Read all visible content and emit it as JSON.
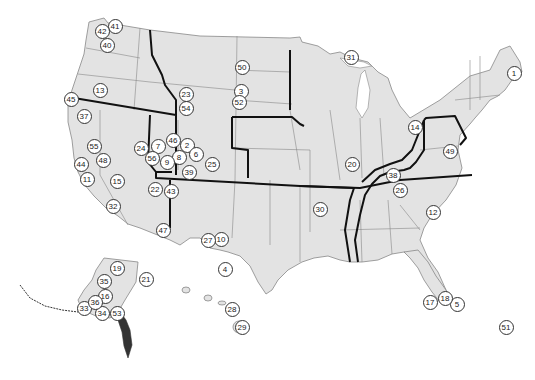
{
  "map": {
    "land_color": "#e3e3e3",
    "state_border_color": "#888888",
    "region_border_color": "#111111",
    "background_color": "#ffffff"
  },
  "markers": [
    {
      "label": "1",
      "x": 513,
      "y": 72
    },
    {
      "label": "2",
      "x": 186,
      "y": 144
    },
    {
      "label": "3",
      "x": 240,
      "y": 90
    },
    {
      "label": "4",
      "x": 224,
      "y": 268
    },
    {
      "label": "5",
      "x": 456,
      "y": 303
    },
    {
      "label": "6",
      "x": 195,
      "y": 153
    },
    {
      "label": "7",
      "x": 157,
      "y": 145
    },
    {
      "label": "8",
      "x": 178,
      "y": 156
    },
    {
      "label": "9",
      "x": 166,
      "y": 161
    },
    {
      "label": "10",
      "x": 220,
      "y": 238
    },
    {
      "label": "11",
      "x": 86,
      "y": 178
    },
    {
      "label": "12",
      "x": 432,
      "y": 211
    },
    {
      "label": "13",
      "x": 99,
      "y": 89
    },
    {
      "label": "14",
      "x": 414,
      "y": 126
    },
    {
      "label": "15",
      "x": 116,
      "y": 180
    },
    {
      "label": "16",
      "x": 104,
      "y": 295
    },
    {
      "label": "17",
      "x": 429,
      "y": 301
    },
    {
      "label": "18",
      "x": 444,
      "y": 297
    },
    {
      "label": "19",
      "x": 116,
      "y": 267
    },
    {
      "label": "20",
      "x": 351,
      "y": 163
    },
    {
      "label": "21",
      "x": 145,
      "y": 278
    },
    {
      "label": "22",
      "x": 154,
      "y": 188
    },
    {
      "label": "23",
      "x": 185,
      "y": 93
    },
    {
      "label": "24",
      "x": 140,
      "y": 147
    },
    {
      "label": "25",
      "x": 211,
      "y": 163
    },
    {
      "label": "26",
      "x": 399,
      "y": 189
    },
    {
      "label": "27",
      "x": 207,
      "y": 239
    },
    {
      "label": "28",
      "x": 231,
      "y": 308
    },
    {
      "label": "29",
      "x": 241,
      "y": 326
    },
    {
      "label": "30",
      "x": 319,
      "y": 208
    },
    {
      "label": "31",
      "x": 350,
      "y": 56
    },
    {
      "label": "32",
      "x": 112,
      "y": 205
    },
    {
      "label": "33",
      "x": 83,
      "y": 307
    },
    {
      "label": "34",
      "x": 101,
      "y": 312
    },
    {
      "label": "35",
      "x": 103,
      "y": 280
    },
    {
      "label": "36",
      "x": 94,
      "y": 301
    },
    {
      "label": "37",
      "x": 83,
      "y": 115
    },
    {
      "label": "38",
      "x": 392,
      "y": 174
    },
    {
      "label": "39",
      "x": 188,
      "y": 171
    },
    {
      "label": "40",
      "x": 106,
      "y": 44
    },
    {
      "label": "41",
      "x": 114,
      "y": 25
    },
    {
      "label": "42",
      "x": 101,
      "y": 30
    },
    {
      "label": "43",
      "x": 170,
      "y": 190
    },
    {
      "label": "44",
      "x": 80,
      "y": 163
    },
    {
      "label": "45",
      "x": 70,
      "y": 98
    },
    {
      "label": "46",
      "x": 172,
      "y": 139
    },
    {
      "label": "47",
      "x": 162,
      "y": 229
    },
    {
      "label": "48",
      "x": 102,
      "y": 159
    },
    {
      "label": "49",
      "x": 449,
      "y": 150
    },
    {
      "label": "50",
      "x": 241,
      "y": 66
    },
    {
      "label": "51",
      "x": 505,
      "y": 326
    },
    {
      "label": "52",
      "x": 238,
      "y": 101
    },
    {
      "label": "53",
      "x": 116,
      "y": 312
    },
    {
      "label": "54",
      "x": 185,
      "y": 107
    },
    {
      "label": "55",
      "x": 93,
      "y": 145
    },
    {
      "label": "56",
      "x": 151,
      "y": 157
    }
  ]
}
